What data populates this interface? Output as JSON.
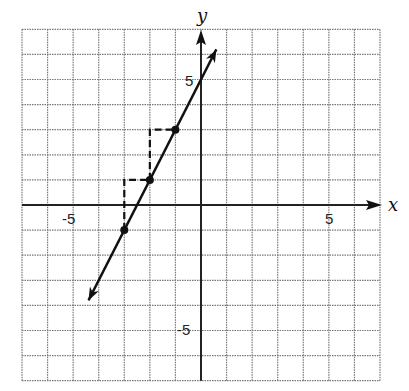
{
  "chart_data": {
    "type": "line",
    "title": "",
    "xlabel": "x",
    "ylabel": "y",
    "xlim": [
      -7,
      7
    ],
    "ylim": [
      -7,
      7
    ],
    "grid": true,
    "grid_style": "dotted",
    "tick_labels": {
      "x": [
        {
          "value": -5,
          "label": "-5"
        },
        {
          "value": 5,
          "label": "5"
        }
      ],
      "y": [
        {
          "value": 5,
          "label": "5"
        },
        {
          "value": -5,
          "label": "-5"
        }
      ]
    },
    "series": [
      {
        "name": "line",
        "equation": "y = 2x + 5",
        "slope": 2,
        "intercept": 5,
        "x_range": [
          -4.4,
          0.6
        ],
        "arrows": "both"
      }
    ],
    "points": [
      {
        "x": -3,
        "y": -1
      },
      {
        "x": -2,
        "y": 1
      },
      {
        "x": -1,
        "y": 3
      }
    ],
    "slope_triangles": [
      {
        "from": {
          "x": -3,
          "y": -1
        },
        "corner": {
          "x": -3,
          "y": 1
        },
        "to": {
          "x": -2,
          "y": 1
        },
        "rise": 2,
        "run": 1
      },
      {
        "from": {
          "x": -2,
          "y": 1
        },
        "corner": {
          "x": -2,
          "y": 3
        },
        "to": {
          "x": -1,
          "y": 3
        },
        "rise": 2,
        "run": 1
      }
    ]
  },
  "labels": {
    "x_axis": "x",
    "y_axis": "y",
    "x_neg5": "-5",
    "x_pos5": "5",
    "y_pos5": "5",
    "y_neg5": "-5"
  }
}
